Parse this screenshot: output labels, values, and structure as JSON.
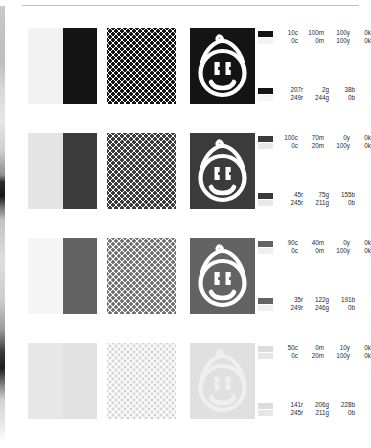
{
  "document": {
    "title": "Color separation proof sheet",
    "type": "print-color-proof"
  },
  "rows": [
    {
      "id": "row-1",
      "top": 28,
      "solid_color": "#141414",
      "tint_color": "#f2f2f2",
      "halftone_color": "#141414",
      "halftone_size": 6,
      "halftone_dot": 4.1,
      "logo_bg": "#141414",
      "logo_fg": "#ffffff",
      "cmyk": {
        "chip_top": "#141414",
        "chip_bottom": "#f4f4f4",
        "line1": {
          "c": "10c",
          "m": "100m",
          "y": "100y",
          "k": "0k"
        },
        "line2": {
          "c": "0c",
          "m": "0m",
          "y": "100y",
          "k": "0k"
        }
      },
      "rgb": {
        "chip_top": "#141414",
        "chip_bottom": "#f4f4f4",
        "line1": {
          "r": "207r",
          "g": "2g",
          "b": "38b"
        },
        "line2": {
          "r": "249r",
          "g": "244g",
          "b": "0b"
        }
      }
    },
    {
      "id": "row-2",
      "top": 133,
      "solid_color": "#3b3b3b",
      "tint_color": "#e4e4e4",
      "halftone_color": "#3b3b3b",
      "halftone_size": 6,
      "halftone_dot": 3.9,
      "logo_bg": "#3b3b3b",
      "logo_fg": "#ffffff",
      "cmyk": {
        "chip_top": "#3b3b3b",
        "chip_bottom": "#e8e8e8",
        "line1": {
          "c": "100c",
          "m": "70m",
          "y": "0y",
          "k": "0k"
        },
        "line2": {
          "c": "0c",
          "m": "20m",
          "y": "100y",
          "k": "0k"
        }
      },
      "rgb": {
        "chip_top": "#3b3b3b",
        "chip_bottom": "#e8e8e8",
        "line1": {
          "r": "45r",
          "g": "75g",
          "b": "155b"
        },
        "line2": {
          "r": "245r",
          "g": "211g",
          "b": "0b"
        }
      }
    },
    {
      "id": "row-3",
      "top": 238,
      "solid_color": "#636363",
      "tint_color": "#f5f5f5",
      "halftone_color": "#6b6b6b",
      "halftone_size": 6,
      "halftone_dot": 3.6,
      "logo_bg": "#636363",
      "logo_fg": "#ffffff",
      "cmyk": {
        "chip_top": "#636363",
        "chip_bottom": "#efefef",
        "line1": {
          "c": "90c",
          "m": "40m",
          "y": "0y",
          "k": "0k"
        },
        "line2": {
          "c": "0c",
          "m": "0m",
          "y": "100y",
          "k": "0k"
        }
      },
      "rgb": {
        "chip_top": "#636363",
        "chip_bottom": "#efefef",
        "line1": {
          "r": "35r",
          "g": "122g",
          "b": "191b"
        },
        "line2": {
          "r": "249r",
          "g": "246g",
          "b": "0b"
        }
      }
    },
    {
      "id": "row-4",
      "top": 343,
      "solid_color": "#e2e2e2",
      "tint_color": "#e7e7e7",
      "halftone_color": "#d6d6d6",
      "halftone_size": 6,
      "halftone_dot": 3.4,
      "logo_bg": "#e0e0e0",
      "logo_fg": "#efefef",
      "cmyk": {
        "chip_top": "#dcdcdc",
        "chip_bottom": "#e6e6e6",
        "line1": {
          "c": "50c",
          "m": "0m",
          "y": "10y",
          "k": "0k"
        },
        "line2": {
          "c": "0c",
          "m": "20m",
          "y": "100y",
          "k": "0k"
        }
      },
      "rgb": {
        "chip_top": "#dcdcdc",
        "chip_bottom": "#e6e6e6",
        "line1": {
          "r": "141r",
          "g": "206g",
          "b": "228b"
        },
        "line2": {
          "r": "245r",
          "g": "211g",
          "b": "0b"
        }
      }
    }
  ]
}
